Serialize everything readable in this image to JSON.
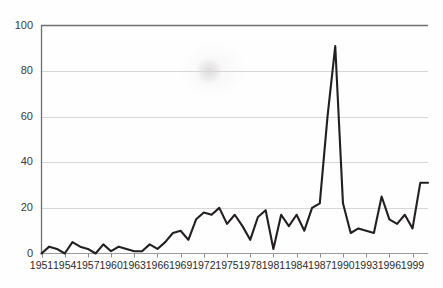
{
  "chart_data": {
    "type": "line",
    "title": "",
    "subtitle": "",
    "xlabel": "",
    "ylabel": "",
    "xlim": [
      1951,
      2001
    ],
    "ylim": [
      0,
      100
    ],
    "grid": true,
    "legend": null,
    "line_color": "#231f20",
    "grid_color": "#d7d7d7",
    "axis_color": "#6f6f6f",
    "y_ticks": [
      0,
      20,
      40,
      60,
      80,
      100
    ],
    "y_tick_labels": [
      "0",
      "20",
      "40",
      "60",
      "80",
      "100"
    ],
    "x_ticks": [
      1951,
      1954,
      1957,
      1960,
      1963,
      1966,
      1969,
      1972,
      1975,
      1978,
      1981,
      1984,
      1987,
      1990,
      1993,
      1996,
      1999
    ],
    "x_tick_labels": [
      "1951",
      "1954",
      "1957",
      "1960",
      "1963",
      "1966",
      "1969",
      "1972",
      "1975",
      "1978",
      "1981",
      "1984",
      "1987",
      "1990",
      "1993",
      "1996",
      "1999"
    ],
    "x": [
      1951,
      1952,
      1953,
      1954,
      1955,
      1956,
      1957,
      1958,
      1959,
      1960,
      1961,
      1962,
      1963,
      1964,
      1965,
      1966,
      1967,
      1968,
      1969,
      1970,
      1971,
      1972,
      1973,
      1974,
      1975,
      1976,
      1977,
      1978,
      1979,
      1980,
      1981,
      1982,
      1983,
      1984,
      1985,
      1986,
      1987,
      1988,
      1989,
      1990,
      1991,
      1992,
      1993,
      1994,
      1995,
      1996,
      1997,
      1998,
      1999,
      2000,
      2001
    ],
    "values": [
      0,
      3,
      2,
      0,
      5,
      3,
      2,
      0,
      4,
      1,
      3,
      2,
      1,
      1,
      4,
      2,
      5,
      9,
      10,
      6,
      15,
      18,
      17,
      20,
      13,
      17,
      12,
      6,
      16,
      19,
      2,
      17,
      12,
      17,
      10,
      20,
      22,
      60,
      91,
      22,
      9,
      11,
      10,
      9,
      25,
      15,
      13,
      17,
      11,
      31,
      31
    ]
  },
  "axes": {
    "y_axis_name": "value-axis",
    "x_axis_name": "year-axis"
  }
}
